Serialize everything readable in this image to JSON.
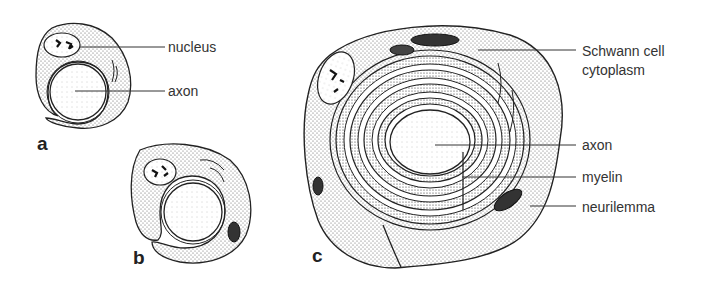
{
  "figure": {
    "panels": [
      {
        "id": "a",
        "letter": "a",
        "labels": [
          "nucleus",
          "axon"
        ]
      },
      {
        "id": "b",
        "letter": "b",
        "labels": []
      },
      {
        "id": "c",
        "letter": "c",
        "labels": [
          "Schwann cell cytoplasm",
          "axon",
          "myelin",
          "neurilemma"
        ]
      }
    ],
    "labels": {
      "a_nucleus": "nucleus",
      "a_axon": "axon",
      "c_schwann_line1": "Schwann cell",
      "c_schwann_line2": "cytoplasm",
      "c_axon": "axon",
      "c_myelin": "myelin",
      "c_neurilemma": "neurilemma"
    },
    "letters": {
      "a": "a",
      "b": "b",
      "c": "c"
    },
    "colors": {
      "ink": "#222222",
      "background": "#ffffff",
      "stipple": "#555555"
    }
  }
}
